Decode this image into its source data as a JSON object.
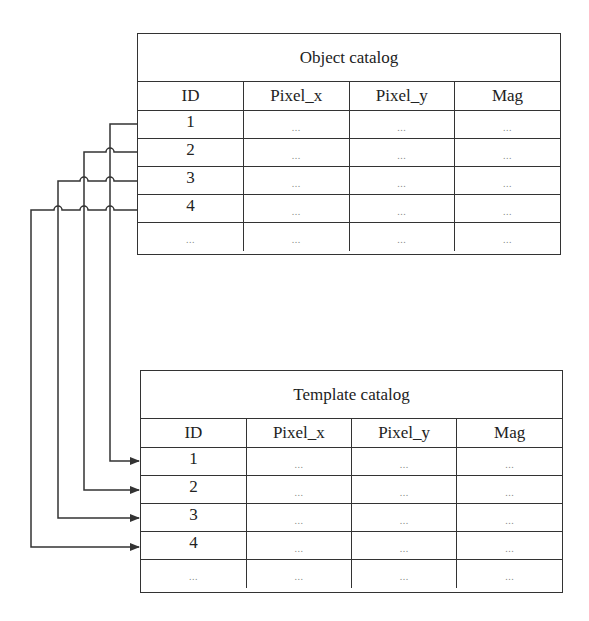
{
  "object_catalog": {
    "title": "Object catalog",
    "columns": [
      "ID",
      "Pixel_x",
      "Pixel_y",
      "Mag"
    ],
    "rows": [
      [
        "1",
        "...",
        "...",
        "..."
      ],
      [
        "2",
        "...",
        "...",
        "..."
      ],
      [
        "3",
        "...",
        "...",
        "..."
      ],
      [
        "4",
        "...",
        "...",
        "..."
      ],
      [
        "...",
        "...",
        "...",
        "..."
      ]
    ]
  },
  "template_catalog": {
    "title": "Template catalog",
    "columns": [
      "ID",
      "Pixel_x",
      "Pixel_y",
      "Mag"
    ],
    "rows": [
      [
        "1",
        "...",
        "...",
        "..."
      ],
      [
        "2",
        "...",
        "...",
        "..."
      ],
      [
        "3",
        "...",
        "...",
        "..."
      ],
      [
        "4",
        "...",
        "...",
        "..."
      ],
      [
        "...",
        "...",
        "...",
        "..."
      ]
    ]
  },
  "connections": [
    {
      "from": "Object catalog ID 1",
      "to": "Template catalog ID 1"
    },
    {
      "from": "Object catalog ID 2",
      "to": "Template catalog ID 2"
    },
    {
      "from": "Object catalog ID 3",
      "to": "Template catalog ID 3"
    },
    {
      "from": "Object catalog ID 4",
      "to": "Template catalog ID 4"
    }
  ],
  "colors": {
    "line": "#333333",
    "text": "#222222",
    "ellipsis": "#888888"
  }
}
